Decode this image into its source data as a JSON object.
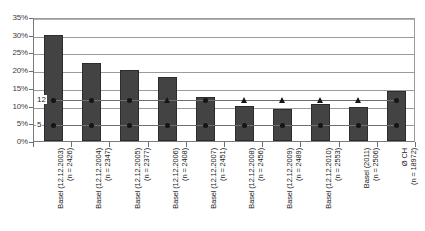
{
  "chart_data": {
    "type": "bar",
    "title": "",
    "subtitle": "",
    "xlabel": "",
    "ylabel": "",
    "ylim": [
      0,
      35
    ],
    "yticks": [
      0,
      5,
      10,
      15,
      20,
      25,
      30,
      35
    ],
    "ytick_labels": [
      "0%",
      "5%",
      "10%",
      "15%",
      "20%",
      "25%",
      "30%",
      "35%"
    ],
    "grid": true,
    "legend": "none",
    "y_unit": "percent",
    "categories": [
      "Basel (12.12.2003)\n(n = 2426)",
      "Basel (12.12.2004)\n(n = 2347)",
      "Basel (12.12.2005)\n(n = 2377)",
      "Basel (12.12.2006)\n(n = 2408)",
      "Basel (12.12.2007)\n(n = 2451)",
      "Basel (12.12.2008)\n(n = 2456)",
      "Basel (12.12.2009)\n(n = 2489)",
      "Basel (12.12.2010)\n(n = 2553)",
      "Basel (2011)\n(n = 2506)",
      "Ø CH\n(n = 18972)"
    ],
    "category_lines": [
      [
        "Basel (12.12.2003)",
        "(n = 2426)"
      ],
      [
        "Basel (12.12.2004)",
        "(n = 2347)"
      ],
      [
        "Basel (12.12.2005)",
        "(n = 2377)"
      ],
      [
        "Basel (12.12.2006)",
        "(n = 2408)"
      ],
      [
        "Basel (12.12.2007)",
        "(n = 2451)"
      ],
      [
        "Basel (12.12.2008)",
        "(n = 2456)"
      ],
      [
        "Basel (12.12.2009)",
        "(n = 2489)"
      ],
      [
        "Basel (12.12.2010)",
        "(n = 2553)"
      ],
      [
        "Basel (2011)",
        "(n = 2506)"
      ],
      [
        "Ø CH",
        "(n = 18972)"
      ]
    ],
    "values": [
      30.0,
      22.0,
      20.0,
      18.0,
      12.5,
      10.0,
      9.0,
      10.5,
      9.5,
      14.0
    ],
    "series": [
      {
        "name": "bars",
        "type": "bar",
        "values": [
          30.0,
          22.0,
          20.0,
          18.0,
          12.5,
          10.0,
          9.0,
          10.5,
          9.5,
          14.0
        ]
      },
      {
        "name": "reference-upper",
        "type": "line",
        "marker": "mixed",
        "markers": [
          "dot",
          "dot",
          "dot",
          "triangle",
          "dot",
          "triangle",
          "triangle",
          "triangle",
          "triangle",
          "dot"
        ],
        "values": [
          12,
          12,
          12,
          12,
          12,
          12,
          12,
          12,
          12,
          12
        ]
      },
      {
        "name": "reference-lower",
        "type": "line",
        "marker": "dot",
        "markers": [
          "dot",
          "dot",
          "dot",
          "dot",
          "dot",
          "dot",
          "dot",
          "dot",
          "dot",
          "dot"
        ],
        "values": [
          5,
          5,
          5,
          5,
          5,
          5,
          5,
          5,
          5,
          5
        ]
      }
    ],
    "inline_labels": [
      {
        "text": "12",
        "value": 12
      },
      {
        "text": "5",
        "value": 5
      }
    ],
    "colors": {
      "bar_fill": "#434343",
      "bar_border": "#2c2c2c",
      "marker": "#151515",
      "gridline": "#9b9b9b",
      "axis": "#6e6e6e",
      "background": "#ffffff",
      "text": "#1c1c1c"
    }
  }
}
